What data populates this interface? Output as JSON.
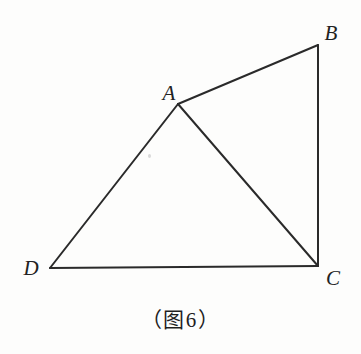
{
  "figure": {
    "caption": "（图 6）",
    "caption_open_paren": "（",
    "caption_word": "图",
    "caption_number": "6",
    "caption_close_paren": "）",
    "background_color": "#fdfdfc",
    "stroke_color": "#2a2a2a",
    "label_color": "#222222",
    "stroke_width": 2,
    "width": 361,
    "height": 354
  },
  "chart_data": {
    "type": "diagram",
    "shape": "quadrilateral with diagonal",
    "xlabel": "",
    "ylabel": "",
    "vertices": [
      {
        "id": "A",
        "label": "A",
        "x": 178,
        "y": 104,
        "label_x": 169,
        "label_y": 93
      },
      {
        "id": "B",
        "label": "B",
        "x": 318,
        "y": 45,
        "label_x": 331,
        "label_y": 33
      },
      {
        "id": "C",
        "label": "C",
        "x": 318,
        "y": 266,
        "label_x": 333,
        "label_y": 278
      },
      {
        "id": "D",
        "label": "D",
        "x": 50,
        "y": 268,
        "label_x": 31,
        "label_y": 268
      }
    ],
    "edges": [
      {
        "id": "AB",
        "from": "A",
        "to": "B"
      },
      {
        "id": "BC",
        "from": "B",
        "to": "C"
      },
      {
        "id": "CD",
        "from": "C",
        "to": "D"
      },
      {
        "id": "DA",
        "from": "D",
        "to": "A"
      },
      {
        "id": "AC",
        "from": "A",
        "to": "C"
      }
    ]
  },
  "labels": {
    "A": "A",
    "B": "B",
    "C": "C",
    "D": "D"
  }
}
